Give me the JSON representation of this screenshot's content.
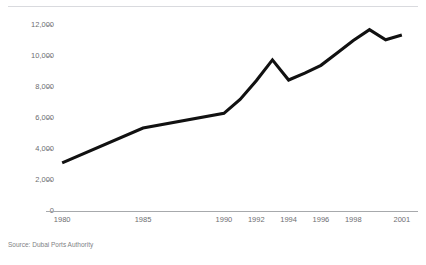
{
  "chart_data": {
    "type": "line",
    "title": "Dubai container traffic",
    "subtitle": "",
    "xlabel": "",
    "ylabel": "",
    "xlim": [
      1979,
      2002
    ],
    "ylim": [
      0,
      12000
    ],
    "grid": false,
    "legend": "none",
    "line_color": "#111111",
    "x_tick_labels": [
      "1980",
      "1985",
      "1990",
      "1992",
      "1994",
      "1996",
      "1998",
      "2001"
    ],
    "x_tick_values": [
      1980,
      1985,
      1990,
      1992,
      1994,
      1996,
      1998,
      2001
    ],
    "y_tick_labels": [
      "0",
      "2,000",
      "4,000",
      "6,000",
      "8,000",
      "10,000",
      "12,000"
    ],
    "y_tick_values": [
      0,
      2000,
      4000,
      6000,
      8000,
      10000,
      12000
    ],
    "x": [
      1980,
      1985,
      1990,
      1991,
      1992,
      1993,
      1994,
      1995,
      1996,
      1997,
      1998,
      1999,
      2000,
      2001
    ],
    "values": [
      3100,
      5350,
      6300,
      7200,
      8400,
      9750,
      8450,
      8900,
      9400,
      10200,
      11000,
      11700,
      11050,
      11350
    ],
    "series": [
      {
        "name": "Container traffic",
        "values": [
          3100,
          5350,
          6300,
          7200,
          8400,
          9750,
          8450,
          8900,
          9400,
          10200,
          11000,
          11700,
          11050,
          11350
        ]
      }
    ]
  },
  "source": {
    "note": "Source: Dubai Ports Authority"
  }
}
